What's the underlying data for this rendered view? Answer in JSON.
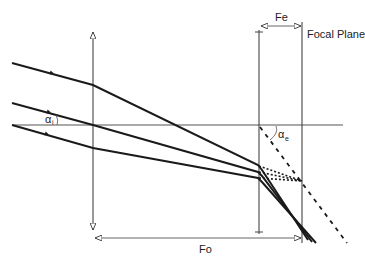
{
  "diagram": {
    "labels": {
      "fe": "Fe",
      "focal_plane": "Focal Plane",
      "fo": "Fo",
      "alpha_i": "α",
      "alpha_i_sub": "i",
      "alpha_e": "α",
      "alpha_e_sub": "e"
    },
    "colors": {
      "ray": "#1a1a1a",
      "guide": "#555555"
    }
  }
}
